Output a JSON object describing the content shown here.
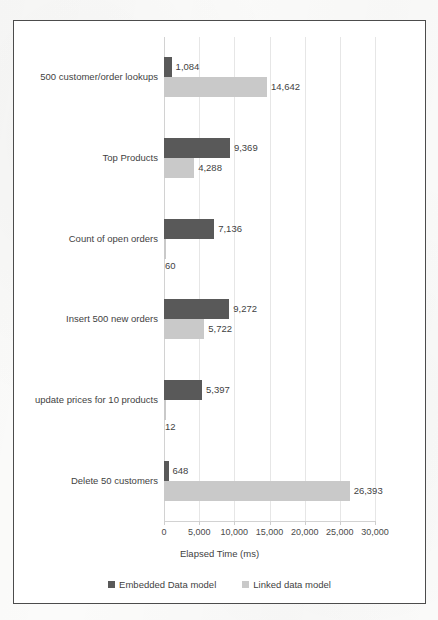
{
  "chart_data": {
    "type": "bar",
    "orientation": "horizontal",
    "title": "",
    "xlabel": "Elapsed Time (ms)",
    "ylabel": "",
    "xlim": [
      0,
      30000
    ],
    "xticks": [
      "0",
      "5,000",
      "10,000",
      "15,000",
      "20,000",
      "25,000",
      "30,000"
    ],
    "xtick_values": [
      0,
      5000,
      10000,
      15000,
      20000,
      25000,
      30000
    ],
    "grid": "vertical",
    "legend_position": "bottom",
    "categories": [
      "500 customer/order lookups",
      "Top Products",
      "Count of open orders",
      "Insert 500 new orders",
      "update prices for 10 products",
      "Delete 50 customers"
    ],
    "series": [
      {
        "name": "Embedded Data model",
        "color": "#595959",
        "values": [
          1084,
          9369,
          7136,
          9272,
          5397,
          648
        ],
        "labels": [
          "1,084",
          "9,369",
          "7,136",
          "9,272",
          "5,397",
          "648"
        ]
      },
      {
        "name": "Linked data model",
        "color": "#c9c9c9",
        "values": [
          14642,
          4288,
          60,
          5722,
          12,
          26393
        ],
        "labels": [
          "14,642",
          "4,288",
          "60",
          "5,722",
          "12",
          "26,393"
        ]
      }
    ]
  },
  "colors": {
    "embedded": "#595959",
    "linked": "#c9c9c9",
    "frame": "#4c4c4c",
    "gridline": "#e6e6e6",
    "text": "#3f3f3f",
    "page": "#fbfbfa"
  }
}
